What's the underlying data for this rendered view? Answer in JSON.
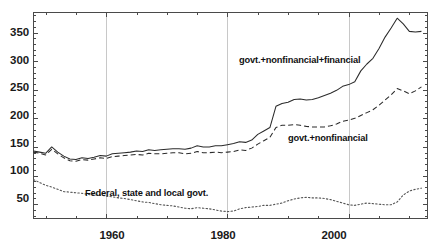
{
  "chart_data": {
    "type": "line",
    "title": "",
    "xlabel": "",
    "ylabel": "",
    "xlim": [
      1948,
      2013
    ],
    "ylim": [
      25,
      385
    ],
    "grid": "vertical-gridlines-at-major-x-ticks",
    "legend_position": "inline-annotations",
    "x_ticks_major": [
      1960,
      1980,
      2000
    ],
    "x_tick_labels": [
      "1960",
      "1980",
      "2000"
    ],
    "x_ticks_minor_step": 5,
    "y_ticks_major": [
      50,
      100,
      150,
      200,
      250,
      300,
      350
    ],
    "y_tick_labels": [
      "50",
      "100",
      "150",
      "200",
      "250",
      "300",
      "350"
    ],
    "y_ticks_minor_step": 10,
    "series": [
      {
        "name": "govt.+nonfinancial+financial",
        "style": "solid",
        "color": "#2b2b2b",
        "annotation": "govt.+nonfinancial+financial",
        "annotation_x": 1985,
        "annotation_y": 295,
        "x": [
          1948,
          1949,
          1950,
          1951,
          1952,
          1953,
          1954,
          1955,
          1956,
          1957,
          1958,
          1959,
          1960,
          1961,
          1962,
          1963,
          1964,
          1965,
          1966,
          1967,
          1968,
          1969,
          1970,
          1971,
          1972,
          1973,
          1974,
          1975,
          1976,
          1977,
          1978,
          1979,
          1980,
          1981,
          1982,
          1983,
          1984,
          1985,
          1986,
          1987,
          1988,
          1989,
          1990,
          1991,
          1992,
          1993,
          1994,
          1995,
          1996,
          1997,
          1998,
          1999,
          2000,
          2001,
          2002,
          2003,
          2004,
          2005,
          2006,
          2007,
          2008,
          2009,
          2010,
          2011,
          2012
        ],
        "values": [
          143,
          141,
          139,
          150,
          141,
          134,
          129,
          128,
          131,
          130,
          132,
          135,
          134,
          138,
          139,
          140,
          141,
          143,
          142,
          145,
          144,
          145,
          146,
          147,
          147,
          146,
          148,
          152,
          150,
          150,
          152,
          152,
          154,
          156,
          159,
          158,
          162,
          172,
          178,
          184,
          221,
          226,
          228,
          233,
          234,
          232,
          233,
          236,
          240,
          244,
          249,
          256,
          259,
          264,
          283,
          295,
          305,
          322,
          342,
          358,
          375,
          365,
          352,
          351,
          352
        ]
      },
      {
        "name": "govt.+nonfinancial",
        "style": "dashed",
        "color": "#2b2b2b",
        "annotation": "govt.+nonfinancial",
        "annotation_x": 1996,
        "annotation_y": 174,
        "x": [
          1948,
          1949,
          1950,
          1951,
          1952,
          1953,
          1954,
          1955,
          1956,
          1957,
          1958,
          1959,
          1960,
          1961,
          1962,
          1963,
          1964,
          1965,
          1966,
          1967,
          1968,
          1969,
          1970,
          1971,
          1972,
          1973,
          1974,
          1975,
          1976,
          1977,
          1978,
          1979,
          1980,
          1981,
          1982,
          1983,
          1984,
          1985,
          1986,
          1987,
          1988,
          1989,
          1990,
          1991,
          1992,
          1993,
          1994,
          1995,
          1996,
          1997,
          1998,
          1999,
          2000,
          2001,
          2002,
          2003,
          2004,
          2005,
          2006,
          2007,
          2008,
          2009,
          2010,
          2011,
          2012
        ],
        "values": [
          141,
          139,
          136,
          146,
          138,
          131,
          126,
          125,
          128,
          127,
          129,
          131,
          130,
          133,
          134,
          135,
          136,
          137,
          136,
          139,
          138,
          138,
          139,
          140,
          140,
          138,
          139,
          142,
          140,
          140,
          141,
          140,
          141,
          142,
          145,
          144,
          148,
          155,
          161,
          167,
          184,
          188,
          188,
          189,
          188,
          186,
          185,
          185,
          185,
          187,
          190,
          195,
          197,
          200,
          205,
          210,
          215,
          223,
          232,
          241,
          252,
          248,
          243,
          248,
          255
        ]
      },
      {
        "name": "Federal, state and local govt.",
        "style": "dotted",
        "color": "#555555",
        "annotation": "Federal, state and local govt.",
        "annotation_x": 1962,
        "annotation_y": 73,
        "x": [
          1948,
          1949,
          1950,
          1951,
          1952,
          1953,
          1954,
          1955,
          1956,
          1957,
          1958,
          1959,
          1960,
          1961,
          1962,
          1963,
          1964,
          1965,
          1966,
          1967,
          1968,
          1969,
          1970,
          1971,
          1972,
          1973,
          1974,
          1975,
          1976,
          1977,
          1978,
          1979,
          1980,
          1981,
          1982,
          1983,
          1984,
          1985,
          1986,
          1987,
          1988,
          1989,
          1990,
          1991,
          1992,
          1993,
          1994,
          1995,
          1996,
          1997,
          1998,
          1999,
          2000,
          2001,
          2002,
          2003,
          2004,
          2005,
          2006,
          2007,
          2008,
          2009,
          2010,
          2011,
          2012
        ],
        "values": [
          93,
          88,
          83,
          80,
          76,
          72,
          71,
          70,
          69,
          67,
          66,
          66,
          64,
          63,
          61,
          60,
          58,
          56,
          54,
          53,
          51,
          49,
          48,
          47,
          45,
          43,
          42,
          44,
          43,
          42,
          40,
          38,
          37,
          38,
          42,
          44,
          45,
          46,
          48,
          48,
          50,
          52,
          56,
          59,
          61,
          62,
          61,
          61,
          60,
          58,
          55,
          52,
          49,
          48,
          50,
          52,
          51,
          50,
          49,
          49,
          54,
          66,
          73,
          76,
          78
        ]
      }
    ]
  },
  "axes": {
    "y_labels": [
      "350",
      "300",
      "250",
      "200",
      "150",
      "100",
      "50"
    ],
    "x_labels": [
      "1960",
      "1980",
      "2000"
    ]
  },
  "annotations": {
    "series1": "govt.+nonfinancial+financial",
    "series2": "govt.+nonfinancial",
    "series3": "Federal, state and local govt."
  },
  "colors": {
    "axis": "#4a4a4a",
    "gridline": "#c8c8c8",
    "line_solid": "#2b2b2b",
    "line_dashed": "#2b2b2b",
    "line_dotted": "#555555",
    "text": "#1a1a1a",
    "background": "#ffffff"
  }
}
